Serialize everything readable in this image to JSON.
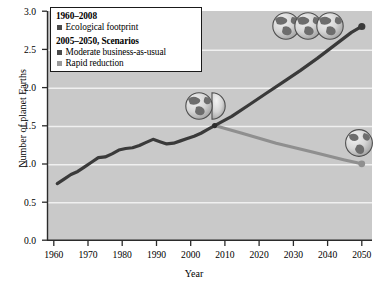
{
  "chart_data": {
    "type": "line",
    "title": "",
    "xlabel": "Year",
    "ylabel": "Number of planet Earths",
    "xlim": [
      1958,
      2053
    ],
    "ylim": [
      0.0,
      3.0
    ],
    "xticks": [
      "1960",
      "1970",
      "1980",
      "1990",
      "2000",
      "2010",
      "2020",
      "2030",
      "2040",
      "2050"
    ],
    "yticks": [
      "0.0",
      "0.5",
      "1.0",
      "1.5",
      "2.0",
      "2.5",
      "3.0"
    ],
    "grid": "horizontal-white",
    "plot_background": "#c9c9c9",
    "legend_position": "top-left-inside",
    "series": [
      {
        "name": "Ecological footprint",
        "period": "1960-2008",
        "color": "#3a3a3a",
        "x": [
          1961,
          1963,
          1965,
          1967,
          1969,
          1971,
          1973,
          1975,
          1977,
          1979,
          1981,
          1983,
          1985,
          1987,
          1989,
          1991,
          1993,
          1995,
          1997,
          1999,
          2001,
          2003,
          2005,
          2007
        ],
        "values": [
          0.74,
          0.8,
          0.86,
          0.9,
          0.96,
          1.02,
          1.08,
          1.09,
          1.13,
          1.18,
          1.2,
          1.21,
          1.24,
          1.28,
          1.32,
          1.29,
          1.26,
          1.27,
          1.3,
          1.33,
          1.36,
          1.4,
          1.45,
          1.5
        ]
      },
      {
        "name": "Moderate business-as-usual",
        "period": "2005-2050, Scenarios",
        "color": "#3a3a3a",
        "x": [
          2007,
          2012,
          2017,
          2022,
          2027,
          2032,
          2037,
          2042,
          2047,
          2050
        ],
        "values": [
          1.5,
          1.62,
          1.77,
          1.92,
          2.07,
          2.22,
          2.38,
          2.55,
          2.72,
          2.8
        ]
      },
      {
        "name": "Rapid reduction",
        "period": "2005-2050, Scenarios",
        "color": "#8f8f8f",
        "x": [
          2007,
          2015,
          2025,
          2035,
          2045,
          2050
        ],
        "values": [
          1.5,
          1.4,
          1.27,
          1.16,
          1.05,
          1.0
        ]
      }
    ],
    "annotations": [
      {
        "name": "globe-cluster-three",
        "label": "3 planet Earths",
        "x": 2038,
        "y": 2.85,
        "count": 3
      },
      {
        "name": "globe-cluster-one-and-half",
        "label": "1.5 planet Earths",
        "x": 2006,
        "y": 1.78,
        "count": 1.5
      },
      {
        "name": "globe-single",
        "label": "1 planet Earth",
        "x": 2046,
        "y": 1.28,
        "count": 1
      }
    ]
  },
  "legend": {
    "heading_historical": "1960–2008",
    "heading_scenarios": "2005–2050, Scenarios",
    "items": [
      {
        "label": "Ecological footprint",
        "color": "#4a4a4a"
      },
      {
        "label": "Moderate business-as-usual",
        "color": "#4a4a4a"
      },
      {
        "label": "Rapid reduction",
        "color": "#9a9a9a"
      }
    ]
  },
  "axes": {
    "x_title": "Year",
    "y_title": "Number of planet Earths",
    "x_ticks": [
      "1960",
      "1970",
      "1980",
      "1990",
      "2000",
      "2010",
      "2020",
      "2030",
      "2040",
      "2050"
    ],
    "y_ticks": [
      "3.0",
      "2.5",
      "2.0",
      "1.5",
      "1.0",
      "0.5",
      "0.0"
    ]
  }
}
